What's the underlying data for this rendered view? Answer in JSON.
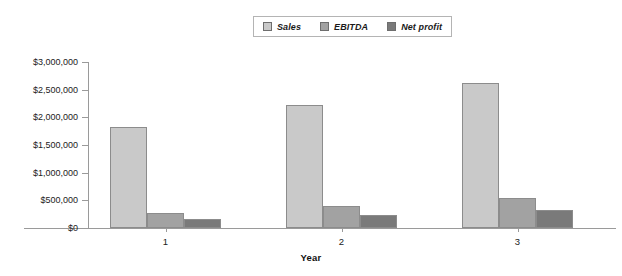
{
  "chart_data": {
    "type": "bar",
    "title": "",
    "xlabel": "Year",
    "ylabel": "",
    "categories": [
      "1",
      "2",
      "3"
    ],
    "series": [
      {
        "name": "Sales",
        "values": [
          1820000,
          2230000,
          2620000
        ],
        "color": "#c9c9c9"
      },
      {
        "name": "EBITDA",
        "values": [
          270000,
          400000,
          540000
        ],
        "color": "#a2a2a2"
      },
      {
        "name": "Net profit",
        "values": [
          160000,
          240000,
          330000
        ],
        "color": "#7a7a7a"
      }
    ],
    "ylim": [
      0,
      3000000
    ],
    "ytick_values": [
      0,
      500000,
      1000000,
      1500000,
      2000000,
      2500000,
      3000000
    ],
    "ytick_labels": [
      "$0",
      "$500,000",
      "$1,000,000",
      "$1,500,000",
      "$2,000,000",
      "$2,500,000",
      "$3,000,000"
    ],
    "grid": false,
    "legend_position": "top-center"
  },
  "legend": {
    "entries": [
      {
        "label": "Sales",
        "swatch_color": "#c9c9c9"
      },
      {
        "label": "EBITDA",
        "swatch_color": "#a2a2a2"
      },
      {
        "label": "Net profit",
        "swatch_color": "#7a7a7a"
      }
    ]
  },
  "axes": {
    "x_title": "Year"
  }
}
